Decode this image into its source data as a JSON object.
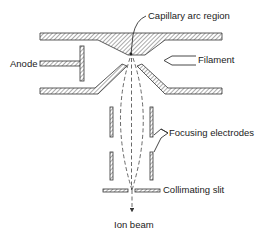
{
  "diagram": {
    "type": "cross-section schematic",
    "labels": {
      "capillary": "Capillary arc region",
      "anode": "Anode",
      "filament": "Filament",
      "focusing": "Focusing electrodes",
      "collimating": "Collimating slit",
      "ion_beam": "Ion beam"
    },
    "colors": {
      "stroke": "#333333",
      "hatch": "#555555",
      "background": "#ffffff",
      "text": "#222222"
    }
  }
}
